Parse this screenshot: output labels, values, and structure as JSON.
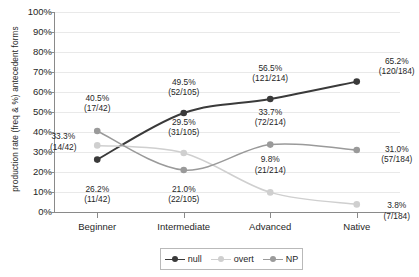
{
  "chart_data": {
    "type": "line",
    "title": "",
    "xlabel": "",
    "ylabel": "production rate (freq & %) antecedent forms",
    "ylim": [
      0,
      100
    ],
    "grid": true,
    "legend_position": "bottom",
    "categories": [
      "Beginner",
      "Intermediate",
      "Advanced",
      "Native"
    ],
    "ytick_labels": [
      "100%",
      "90%",
      "80%",
      "70%",
      "60%",
      "50%",
      "40%",
      "30%",
      "20%",
      "10%",
      "0%"
    ],
    "ytick_values": [
      100,
      90,
      80,
      70,
      60,
      50,
      40,
      30,
      20,
      10,
      0
    ],
    "series": [
      {
        "name": "null",
        "color": "#3a3a3a",
        "values": [
          26.2,
          49.5,
          56.5,
          65.2
        ],
        "labels": [
          "26.2%",
          "49.5%",
          "56.5%",
          "65.2%"
        ],
        "fractions": [
          "(11/42)",
          "(52/105)",
          "(121/214)",
          "(120/184)"
        ]
      },
      {
        "name": "overt",
        "color": "#cfcfcf",
        "values": [
          33.3,
          29.5,
          9.8,
          3.8
        ],
        "labels": [
          "33.3%",
          "29.5%",
          "9.8%",
          "3.8%"
        ],
        "fractions": [
          "(14/42)",
          "(31/105)",
          "(21/214)",
          "(7/184)"
        ]
      },
      {
        "name": "NP",
        "color": "#9a9a9a",
        "values": [
          40.5,
          21.0,
          33.7,
          31.0
        ],
        "labels": [
          "40.5%",
          "21.0%",
          "33.7%",
          "31.0%"
        ],
        "fractions": [
          "(17/42)",
          "(22/105)",
          "(72/214)",
          "(57/184)"
        ]
      }
    ],
    "annotations": [
      {
        "text": "40.5%",
        "sub": "(17/42)",
        "series": "NP",
        "category": "Beginner"
      },
      {
        "text": "33.3%",
        "sub": "(14/42)",
        "series": "overt",
        "category": "Beginner"
      },
      {
        "text": "26.2%",
        "sub": "(11/42)",
        "series": "null",
        "category": "Beginner"
      },
      {
        "text": "49.5%",
        "sub": "(52/105)",
        "series": "null",
        "category": "Intermediate"
      },
      {
        "text": "29.5%",
        "sub": "(31/105)",
        "series": "overt",
        "category": "Intermediate"
      },
      {
        "text": "21.0%",
        "sub": "(22/105)",
        "series": "NP",
        "category": "Intermediate"
      },
      {
        "text": "56.5%",
        "sub": "(121/214)",
        "series": "null",
        "category": "Advanced"
      },
      {
        "text": "33.7%",
        "sub": "(72/214)",
        "series": "NP",
        "category": "Advanced"
      },
      {
        "text": "9.8%",
        "sub": "(21/214)",
        "series": "overt",
        "category": "Advanced"
      },
      {
        "text": "65.2%",
        "sub": "(120/184)",
        "series": "null",
        "category": "Native"
      },
      {
        "text": "31.0%",
        "sub": "(57/184)",
        "series": "NP",
        "category": "Native"
      },
      {
        "text": "3.8%",
        "sub": "(7/184)",
        "series": "overt",
        "category": "Native"
      }
    ]
  },
  "legend": {
    "items": [
      {
        "label": "null",
        "color": "#3a3a3a"
      },
      {
        "label": "overt",
        "color": "#cfcfcf"
      },
      {
        "label": "NP",
        "color": "#9a9a9a"
      }
    ]
  }
}
